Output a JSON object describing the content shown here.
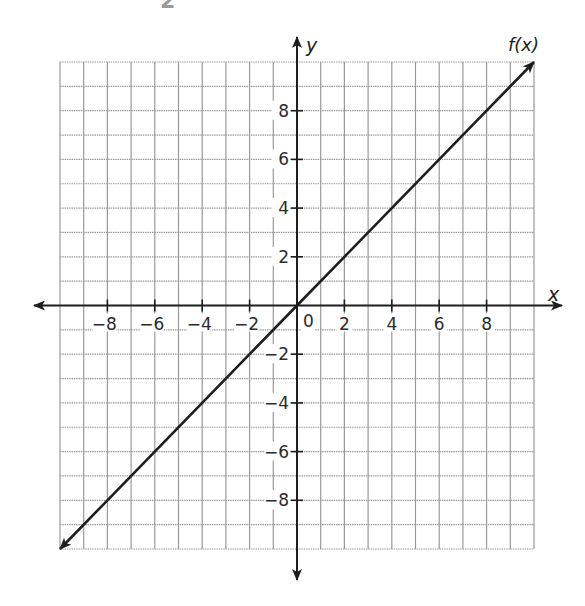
{
  "top_residue": "2",
  "chart_data": {
    "type": "line",
    "title": "",
    "function_label": "f(x)",
    "xlabel": "x",
    "ylabel": "y",
    "xlim": [
      -10,
      10
    ],
    "ylim": [
      -10,
      10
    ],
    "grid": true,
    "grid_step": 1,
    "x_ticks": [
      -8,
      -6,
      -4,
      -2,
      2,
      4,
      6,
      8
    ],
    "y_ticks": [
      8,
      6,
      4,
      2,
      -2,
      -4,
      -6,
      -8
    ],
    "origin_label": "0",
    "series": [
      {
        "name": "f(x)",
        "equation": "f(x) = x",
        "x": [
          -10,
          -8,
          -6,
          -4,
          -2,
          0,
          2,
          4,
          6,
          8,
          10
        ],
        "y": [
          -10,
          -8,
          -6,
          -4,
          -2,
          0,
          2,
          4,
          6,
          8,
          10
        ],
        "arrows_both_ends": true
      }
    ],
    "colors": {
      "grid": "#9a9a9a",
      "axis": "#1e1e1e",
      "line": "#1e1e1e",
      "background": "#ffffff"
    }
  },
  "layout": {
    "grid_left": 60,
    "grid_right": 534,
    "grid_top": 62,
    "grid_bottom": 549,
    "origin_px": [
      297,
      306
    ],
    "x_axis_arrow_left": 34,
    "x_axis_arrow_right": 562,
    "y_axis_arrow_top": 37,
    "y_axis_arrow_bottom": 580
  }
}
